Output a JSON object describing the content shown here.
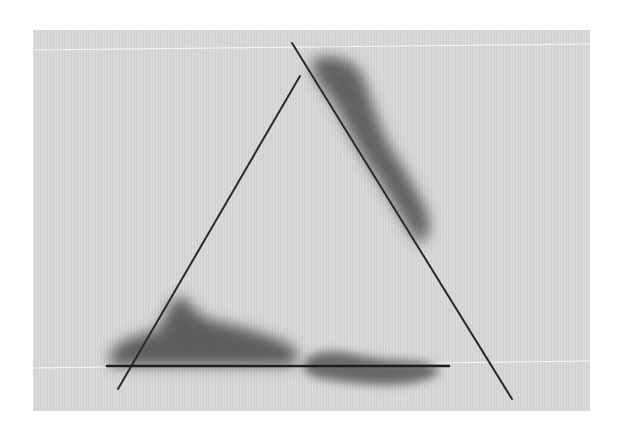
{
  "artwork": {
    "subject": "Abstract triangle of three dark lines over a grey panel with smudged charcoal shadows",
    "colors": {
      "background": "#ffffff",
      "panel": "#d4d4d4",
      "line": "#2a2a2a",
      "smudge": "#555555",
      "highlight_line": "#f4f4f4"
    },
    "panel": {
      "x": 33,
      "y": 30,
      "width": 557,
      "height": 381
    },
    "lines": [
      {
        "name": "right-diagonal",
        "x1": 292,
        "y1": 43,
        "x2": 512,
        "y2": 399
      },
      {
        "name": "left-diagonal",
        "x1": 300,
        "y1": 76,
        "x2": 118,
        "y2": 389
      },
      {
        "name": "base-horizontal",
        "x1": 107,
        "y1": 366,
        "x2": 449,
        "y2": 366
      }
    ],
    "highlight_lines": [
      {
        "x1": 33,
        "y1": 50,
        "x2": 590,
        "y2": 43
      },
      {
        "x1": 33,
        "y1": 368,
        "x2": 590,
        "y2": 361
      }
    ]
  }
}
